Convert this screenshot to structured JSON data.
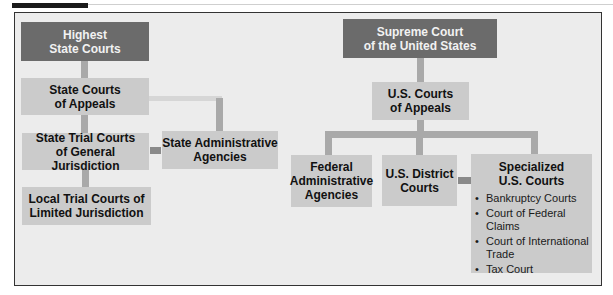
{
  "state_side": {
    "highest": [
      "Highest",
      "State Courts"
    ],
    "appeals": [
      "State Courts",
      "of Appeals"
    ],
    "trial_general": [
      "State Trial Courts",
      "of General Jurisdiction"
    ],
    "admin": [
      "State Administrative",
      "Agencies"
    ],
    "local_limited": [
      "Local Trial Courts of",
      "Limited Jurisdiction"
    ]
  },
  "federal_side": {
    "supreme": [
      "Supreme Court",
      "of the United States"
    ],
    "appeals": [
      "U.S. Courts",
      "of Appeals"
    ],
    "admin": [
      "Federal",
      "Administrative",
      "Agencies"
    ],
    "district": [
      "U.S. District",
      "Courts"
    ],
    "specialized": {
      "title": [
        "Specialized",
        "U.S. Courts"
      ],
      "bullet": "•",
      "items": [
        "Bankruptcy Courts",
        "Court of Federal Claims",
        "Court of International Trade",
        "Tax Court"
      ]
    }
  },
  "colors": {
    "top_tier": "#6b6b6b",
    "lower_tier": "#cbcbcb",
    "background": "#ececec",
    "connector": "#a9a9a9"
  }
}
